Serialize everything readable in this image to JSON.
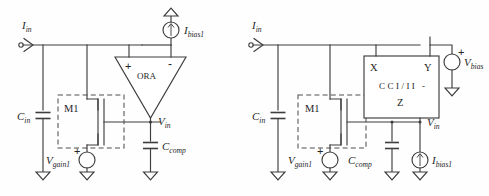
{
  "figure": {
    "background_color": "#fefefe",
    "line_color": "#3d3d3d",
    "text_color": "#262626"
  },
  "circuits": [
    {
      "id": "left-circuit",
      "name": "ORA based input stage",
      "labels": {
        "input_current": {
          "base": "I",
          "sub": "in"
        },
        "bias_current": {
          "base": "I",
          "sub": "bias1"
        },
        "input_cap": {
          "base": "C",
          "sub": "in"
        },
        "comp_cap": {
          "base": "C",
          "sub": "comp"
        },
        "gain_source": {
          "base": "V",
          "sub": "gain1"
        },
        "node_voltage": {
          "base": "V",
          "sub": "in"
        },
        "transistor": "M1",
        "amplifier": "ORA",
        "plus_sign": "+",
        "minus_sign": "-"
      }
    },
    {
      "id": "right-circuit",
      "name": "Current conveyor based input stage",
      "labels": {
        "input_current": {
          "base": "I",
          "sub": "in"
        },
        "bias_current": {
          "base": "I",
          "sub": "bias1"
        },
        "bias_voltage": {
          "base": "V",
          "sub": "bias"
        },
        "input_cap": {
          "base": "C",
          "sub": "in"
        },
        "comp_cap": {
          "base": "C",
          "sub": "comp"
        },
        "gain_source": {
          "base": "V",
          "sub": "gain1"
        },
        "node_voltage": {
          "base": "V",
          "sub": "in"
        },
        "transistor": "M1",
        "conveyor_block": {
          "title_line1": "CCI/II -",
          "title_line2": "Z",
          "port_x": "X",
          "port_y": "Y",
          "port_z": "Z"
        },
        "plus_sign": "+"
      }
    }
  ]
}
